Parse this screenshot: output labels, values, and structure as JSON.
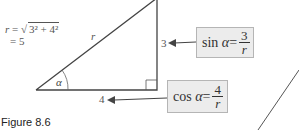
{
  "figure": {
    "caption": "Figure 8.6",
    "hypotenuse_formula": {
      "line1_lhs": "r",
      "line1_eq": " = ",
      "line1_sqrt_symbol": "√",
      "line1_radicand": "3² + 4²",
      "line2": "= 5"
    },
    "triangle": {
      "hypotenuse_label": "r",
      "angle_label": "α",
      "opposite_label": "3",
      "adjacent_label": "4"
    },
    "sin_box": {
      "func": "sin",
      "var": "α",
      "eq": "=",
      "numerator": "3",
      "denominator": "r"
    },
    "cos_box": {
      "func": "cos",
      "var": "α",
      "eq": "=",
      "numerator": "4",
      "denominator": "r"
    },
    "colors": {
      "line": "#444444",
      "box_fill": "#ececec",
      "box_border": "#b5b5b5"
    }
  }
}
